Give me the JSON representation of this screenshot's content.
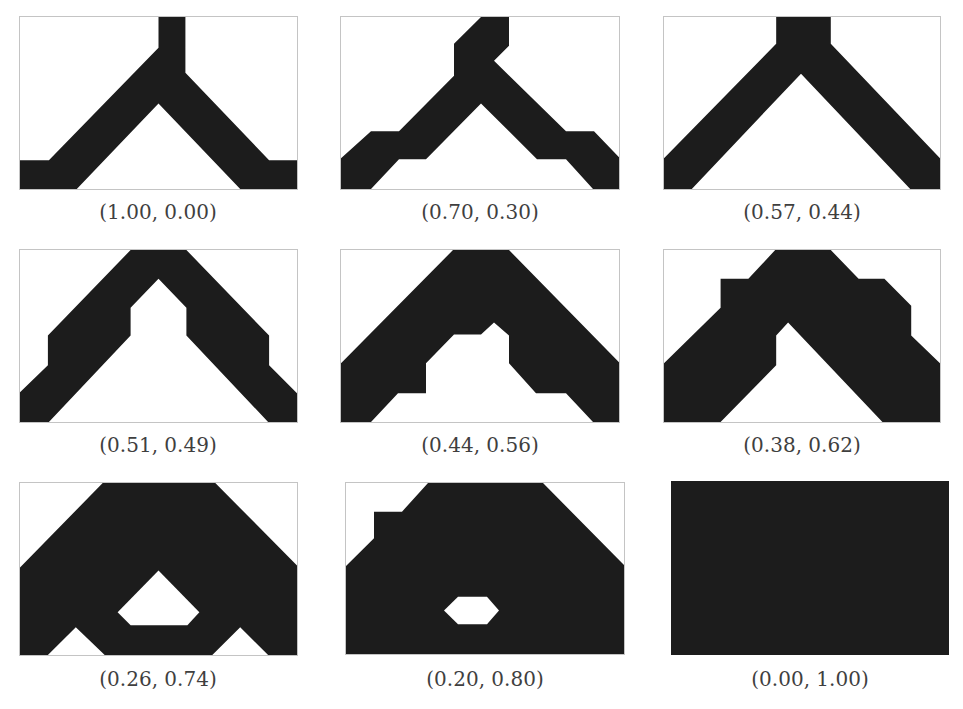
{
  "figure": {
    "colors": {
      "material": "#1c1c1c",
      "void": "#ffffff",
      "frame": "#c4c4c4",
      "label": "#3f3f3f"
    },
    "panels": [
      {
        "label": "(1.00, 0.00)",
        "w1": 1.0,
        "w2": 0.0,
        "shapes": [
          {
            "kind": "polygon",
            "fill": "material",
            "points": "139,0 166,0 166,56 250,144 278,144 278,173 221,173 139,87 57,173 0,173 0,144 29,144 139,31"
          }
        ]
      },
      {
        "label": "(0.70, 0.30)",
        "w1": 0.7,
        "w2": 0.3,
        "shapes": [
          {
            "kind": "polygon",
            "fill": "material",
            "points": "140,0 168,0 168,29 153,44 225,115 253,115 278,141 278,173 252,173 225,143 196,143 140,87 85,143 58,143 30,173 0,173 0,142 30,115 58,115 113,59 113,27"
          }
        ]
      },
      {
        "label": "(0.57, 0.44)",
        "w1": 0.57,
        "w2": 0.44,
        "shapes": [
          {
            "kind": "polygon",
            "fill": "material",
            "points": "113,0 168,0 168,27 278,142 278,173 248,173 138,57 28,173 0,173 0,142 113,27"
          }
        ]
      },
      {
        "label": "(0.51, 0.49)",
        "w1": 0.51,
        "w2": 0.49,
        "shapes": [
          {
            "kind": "polygon",
            "fill": "material",
            "points": "111,0 167,0 250,86 250,116 278,144 278,173 249,173 167,86 167,58 139,29 111,58 111,86 29,173 0,173 0,143 28,116 28,86"
          }
        ]
      },
      {
        "label": "(0.44, 0.56)",
        "w1": 0.44,
        "w2": 0.56,
        "shapes": [
          {
            "kind": "polygon",
            "fill": "material",
            "points": "112,0 168,0 278,113 278,173 252,173 225,144 195,144 168,114 168,86 153,73 140,85 113,85 85,114 85,144 57,144 30,173 0,173 0,114"
          }
        ]
      },
      {
        "label": "(0.38, 0.62)",
        "w1": 0.38,
        "w2": 0.62,
        "shapes": [
          {
            "kind": "polygon",
            "fill": "material",
            "points": "112,0 168,0 196,29 222,29 249,56 249,86 278,114 278,173 220,173 125,73 113,86 113,116 57,173 0,173 0,114 57,58 57,29 85,29"
          }
        ]
      },
      {
        "label": "(0.26, 0.74)",
        "w1": 0.26,
        "w2": 0.74,
        "shapes": [
          {
            "kind": "polygon",
            "fill": "material",
            "points": "83,0 196,0 278,83 278,173 249,173 221,145 193,173 85,173 56,145 28,173 0,173 0,85"
          },
          {
            "kind": "polygon",
            "fill": "void",
            "points": "139,88 180,130 168,143 111,143 98,130"
          }
        ]
      },
      {
        "label": "(0.20, 0.80)",
        "w1": 0.2,
        "w2": 0.8,
        "shapes": [
          {
            "kind": "polygon",
            "fill": "material",
            "points": "82,0 197,0 278,83 278,173 0,173 0,84 28,56 28,29 56,29"
          },
          {
            "kind": "polygon",
            "fill": "void",
            "points": "112,115 141,115 153,129 141,143 112,143 98,129"
          }
        ]
      },
      {
        "label": "(0.00, 1.00)",
        "w1": 0.0,
        "w2": 1.0,
        "shapes": [
          {
            "kind": "polygon",
            "fill": "material",
            "points": "0,0 278,0 278,173 0,173"
          }
        ]
      }
    ]
  }
}
